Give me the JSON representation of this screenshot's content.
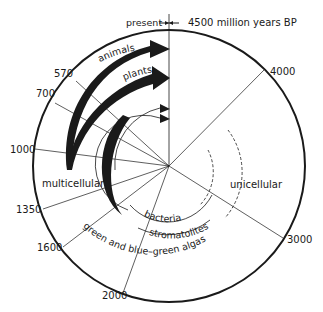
{
  "header": {
    "present_label": "present",
    "bp_label": "4500 million years BP"
  },
  "ticks": [
    {
      "label": "570"
    },
    {
      "label": "700"
    },
    {
      "label": "1000"
    },
    {
      "label": "1350"
    },
    {
      "label": "1600"
    },
    {
      "label": "2000"
    },
    {
      "label": "3000"
    },
    {
      "label": "4000"
    }
  ],
  "arrows": {
    "animals": "animals",
    "plants": "plants"
  },
  "groups": {
    "multicellular": "multicellular",
    "unicellular": "unicellular",
    "bacteria": "bacteria",
    "stromatolites": "stromatolites",
    "algae": "green and blue–green algas"
  },
  "colors": {
    "ink": "#1a1a1a",
    "background": "#ffffff"
  }
}
